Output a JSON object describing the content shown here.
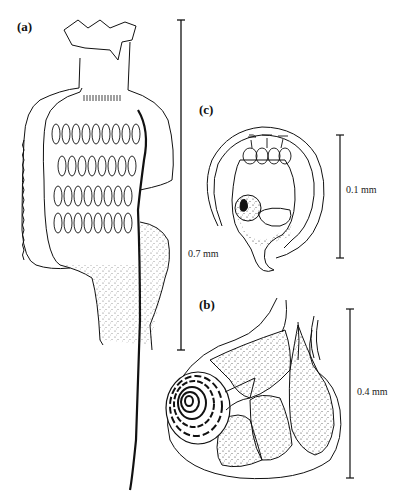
{
  "figure": {
    "panels": [
      {
        "id": "a",
        "label": "(a)",
        "scale_bar": {
          "label": "0.7 mm"
        }
      },
      {
        "id": "b",
        "label": "(b)",
        "scale_bar": {
          "label": "0.4 mm"
        }
      },
      {
        "id": "c",
        "label": "(c)",
        "scale_bar": {
          "label": "0.1 mm"
        }
      }
    ]
  }
}
